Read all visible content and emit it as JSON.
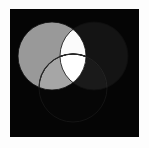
{
  "figure": {
    "background_color": "#fdfdfd",
    "panel_color": "#050505",
    "panel": {
      "x": 10,
      "y": 9,
      "width": 129,
      "height": 128
    }
  },
  "chart_data": {
    "type": "diagram",
    "subtype": "venn",
    "xlabel": "",
    "ylabel": "",
    "grid": false,
    "legend_position": "none",
    "background": "#050505",
    "set_count": 3,
    "sets": [
      {
        "name": "A",
        "label": "",
        "fill": "#999999",
        "cx": 42,
        "cy": 47,
        "r": 34,
        "description": "left circle, medium gray"
      },
      {
        "name": "B",
        "label": "",
        "fill": "#141414",
        "cx": 84,
        "cy": 47,
        "r": 34,
        "description": "right circle, near black"
      },
      {
        "name": "C",
        "label": "",
        "fill": "#00000000",
        "cx": 63,
        "cy": 79,
        "r": 34,
        "description": "bottom circle, transparent with dark outline"
      }
    ],
    "regions": [
      {
        "id": "A_only",
        "sets": [
          "A"
        ],
        "fill": "#999999"
      },
      {
        "id": "B_only",
        "sets": [
          "B"
        ],
        "fill": "#141414"
      },
      {
        "id": "C_only",
        "sets": [
          "C"
        ],
        "fill": "#060606"
      },
      {
        "id": "A_and_B",
        "sets": [
          "A",
          "B"
        ],
        "fill": "#fbfbfb"
      },
      {
        "id": "A_and_C",
        "sets": [
          "A",
          "C"
        ],
        "fill": "#a6a6a6"
      },
      {
        "id": "B_and_C",
        "sets": [
          "B",
          "C"
        ],
        "fill": "#1a1a1a"
      },
      {
        "id": "A_and_B_and_C",
        "sets": [
          "A",
          "B",
          "C"
        ],
        "fill": "#ffffff"
      }
    ],
    "outline": {
      "color": "#101010",
      "width": 0.9
    }
  }
}
